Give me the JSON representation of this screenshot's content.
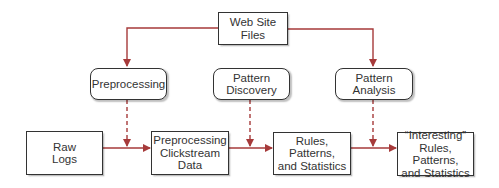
{
  "diagram": {
    "source": {
      "label": "Web Site\nFiles"
    },
    "processes": [
      {
        "label": "Preprocessing"
      },
      {
        "label": "Pattern\nDiscovery"
      },
      {
        "label": "Pattern\nAnalysis"
      }
    ],
    "pipeline": [
      {
        "label": "Raw\nLogs"
      },
      {
        "label": "Preprocessing\nClickstream\nData"
      },
      {
        "label": "Rules, Patterns,\nand Statistics"
      },
      {
        "label": "“Interesting”\nRules, Patterns,\nand Statistics"
      }
    ],
    "colors": {
      "arrow": "#a63a3a",
      "border": "#333333"
    }
  }
}
